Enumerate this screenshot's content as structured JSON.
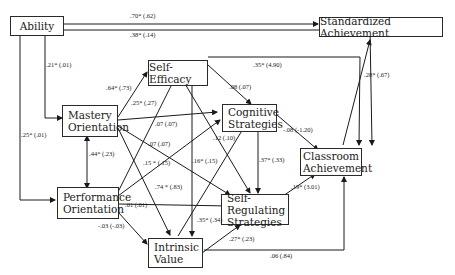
{
  "nodes": {
    "ability": {
      "label": "Ability"
    },
    "standardized": {
      "label": "Standardized Achievement"
    },
    "self_efficacy": {
      "label": "Self-Efficacy"
    },
    "mastery": {
      "line1": "Mastery",
      "line2": "Orientation"
    },
    "cognitive": {
      "line1": "Cognitive",
      "line2": "Strategies"
    },
    "classroom": {
      "line1": "Classroom",
      "line2": "Achievement"
    },
    "performance": {
      "line1": "Performance",
      "line2": "Orientation"
    },
    "self_regulating": {
      "line1": "Self-Regulating",
      "line2": "Strategies"
    },
    "intrinsic": {
      "line1": "Intrinsic",
      "line2": "Value"
    }
  },
  "paths": {
    "ability_standardized": ".70* (.62)",
    "ability_classroom": ".38* (.14)",
    "ability_mastery": ".21* (.01)",
    "ability_performance": ".25* (.01)",
    "mastery_selfefficacy": ".64* (.73)",
    "mastery_cognitive": ".25* (.27)",
    "performance_selfefficacy": ".07 (.07)",
    "performance_cognitive": ".07 (.07)",
    "mastery_selfregulating": ".15 * (.15)",
    "mastery_intrinsic": ".74 * (.83)",
    "mastery_performance": ".44* (.23)",
    "selfefficacy_classroom": ".35* (4.90)",
    "selfefficacy_cognitive": ".08 (.07)",
    "selfefficacy_intrinsic": ".16* (.15)",
    "intrinsic_cognitive": ".12 (.10)",
    "cognitive_classroom": "-.08 (-1.20)",
    "cognitive_selfregulating": ".37* (.33)",
    "selfregulating_classroom": ".19* (3.01)",
    "classroom_standardized": ".28* (.67)",
    "performance_selfregulating": ".01 (.01)",
    "performance_intrinsic": "-.03 (-.03)",
    "intrinsic_selfregulating_a": ".35* (.34)",
    "intrinsic_selfregulating_b": ".27* (.23)",
    "intrinsic_classroom": ".06 (.84)"
  }
}
